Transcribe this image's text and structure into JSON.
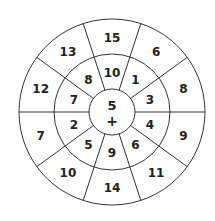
{
  "puzzle": {
    "center": {
      "value": "5",
      "operator": "+"
    },
    "middle_ring": [
      {
        "angle": 90,
        "value": "10"
      },
      {
        "angle": 54,
        "value": "1"
      },
      {
        "angle": 18,
        "value": "3"
      },
      {
        "angle": -18,
        "value": "4"
      },
      {
        "angle": -54,
        "value": "6"
      },
      {
        "angle": -90,
        "value": "9"
      },
      {
        "angle": -126,
        "value": "5"
      },
      {
        "angle": -162,
        "value": "2"
      },
      {
        "angle": 162,
        "value": "7"
      },
      {
        "angle": 126,
        "value": "8"
      }
    ],
    "outer_ring": [
      {
        "angle": 90,
        "value": "15"
      },
      {
        "angle": 54,
        "value": "6"
      },
      {
        "angle": 18,
        "value": "8"
      },
      {
        "angle": -18,
        "value": "9"
      },
      {
        "angle": -54,
        "value": "11"
      },
      {
        "angle": -90,
        "value": "14"
      },
      {
        "angle": -126,
        "value": "10"
      },
      {
        "angle": -162,
        "value": "7"
      },
      {
        "angle": 162,
        "value": "12"
      },
      {
        "angle": 126,
        "value": "13"
      }
    ],
    "colors": {
      "line": "#333333",
      "text": "#222222",
      "background": "#ffffff"
    }
  }
}
